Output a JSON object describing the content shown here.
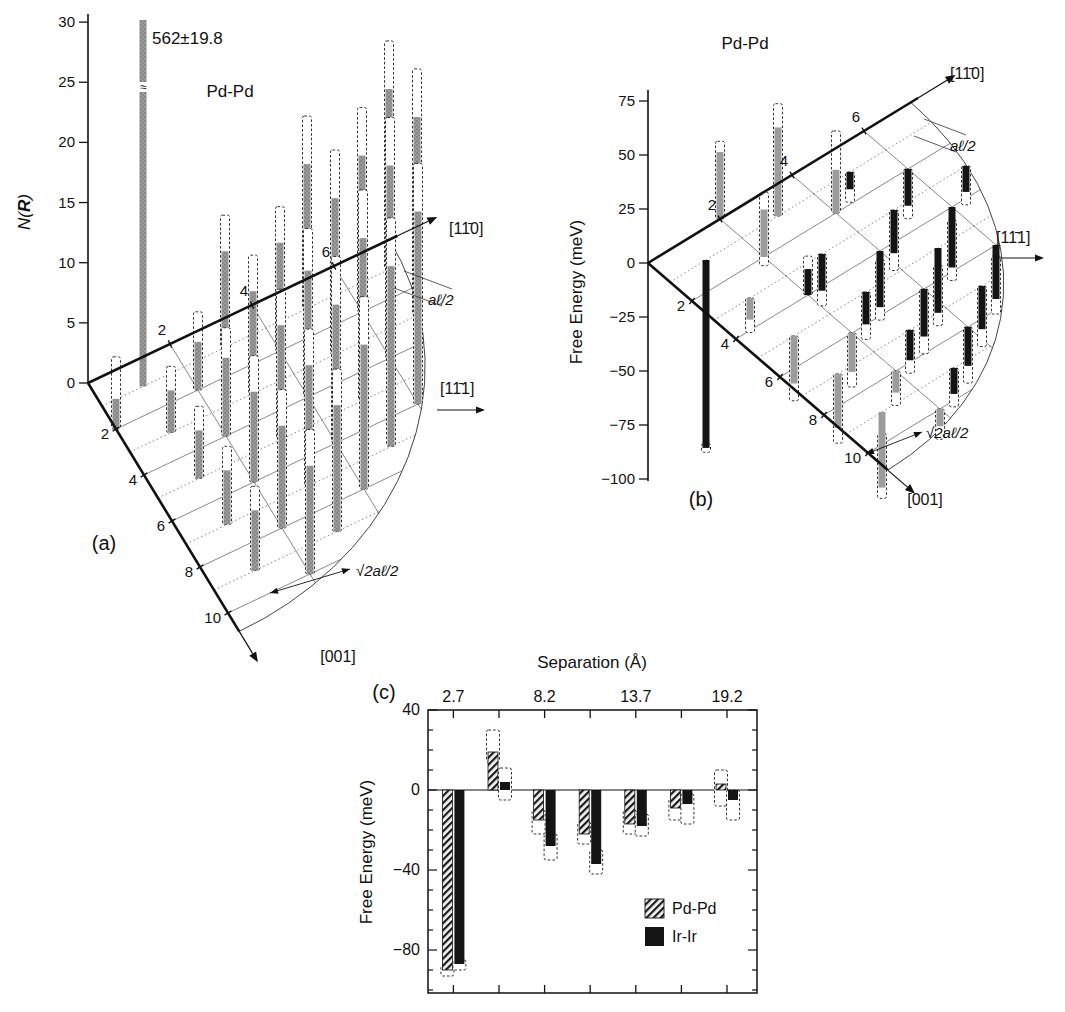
{
  "chart_data": [
    {
      "type": "3d-bar-lattice",
      "panel": "(a)",
      "title": "Pd-Pd",
      "ylabel": "N(R)",
      "ylabel_parts": {
        "pre": "N(",
        "arg": "R",
        "post": ")"
      },
      "yticks": [
        0,
        5,
        10,
        15,
        20,
        25,
        30
      ],
      "axes": {
        "up": "[11̄0]",
        "right": "[11̄1]",
        "down": "[001]"
      },
      "up_ticks": [
        2,
        4,
        6
      ],
      "down_ticks": [
        2,
        4,
        6,
        8,
        10
      ],
      "annotations": {
        "a_half": "aℓ/2",
        "sqrt2_a_half": "√2aℓ/2"
      },
      "peak": {
        "i": 1,
        "j": 1,
        "value": "562±19.8"
      },
      "bars": [
        {
          "i": 0,
          "j": 2,
          "v": 2.5,
          "e": 6
        },
        {
          "i": 2,
          "j": 2,
          "v": 4,
          "e": 6.5
        },
        {
          "i": 4,
          "j": 2,
          "v": 9,
          "e": 12
        },
        {
          "i": 6,
          "j": 2,
          "v": 13,
          "e": 17
        },
        {
          "i": 3,
          "j": 1,
          "v": 8,
          "e": 11
        },
        {
          "i": 5,
          "j": 1,
          "v": 12,
          "e": 16
        },
        {
          "i": 7,
          "j": 1,
          "v": 15,
          "e": 19
        },
        {
          "i": 1,
          "j": 3,
          "v": 3.5,
          "e": 5.5
        },
        {
          "i": 3,
          "j": 3,
          "v": 8.5,
          "e": 11.5
        },
        {
          "i": 5,
          "j": 3,
          "v": 13,
          "e": 17
        },
        {
          "i": 7,
          "j": 3,
          "v": 16.5,
          "e": 20.5
        },
        {
          "i": 2,
          "j": 4,
          "v": 6.5,
          "e": 9
        },
        {
          "i": 4,
          "j": 4,
          "v": 10.5,
          "e": 14
        },
        {
          "i": 6,
          "j": 4,
          "v": 16,
          "e": 20
        },
        {
          "i": 1,
          "j": 5,
          "v": 4,
          "e": 6
        },
        {
          "i": 3,
          "j": 5,
          "v": 9.5,
          "e": 12.5
        },
        {
          "i": 5,
          "j": 5,
          "v": 13.5,
          "e": 17.5
        },
        {
          "i": 2,
          "j": 6,
          "v": 7.5,
          "e": 10.5
        },
        {
          "i": 4,
          "j": 6,
          "v": 11.5,
          "e": 15.5
        },
        {
          "i": 6,
          "j": 6,
          "v": 16,
          "e": 20
        },
        {
          "i": 1,
          "j": 7,
          "v": 4.5,
          "e": 6.5
        },
        {
          "i": 3,
          "j": 7,
          "v": 10,
          "e": 13
        },
        {
          "i": 5,
          "j": 7,
          "v": 15,
          "e": 19
        },
        {
          "i": 2,
          "j": 8,
          "v": 8.5,
          "e": 11.5
        },
        {
          "i": 4,
          "j": 8,
          "v": 12,
          "e": 16
        },
        {
          "i": 1,
          "j": 9,
          "v": 5,
          "e": 7
        },
        {
          "i": 3,
          "j": 9,
          "v": 10.5,
          "e": 13.5
        },
        {
          "i": 2,
          "j": 10,
          "v": 9,
          "e": 12
        }
      ]
    },
    {
      "type": "3d-bar-lattice",
      "panel": "(b)",
      "title": "Pd-Pd",
      "ylabel": "Free Energy (meV)",
      "yticks": [
        75,
        50,
        25,
        0,
        -25,
        -50,
        -75,
        -100
      ],
      "axes": {
        "up": "[11̄0]",
        "right": "[11̄1]",
        "down": "[001]"
      },
      "up_ticks": [
        2,
        4,
        6
      ],
      "down_ticks": [
        2,
        4,
        6,
        8,
        10
      ],
      "annotations": {
        "a_half": "aℓ/2",
        "sqrt2_a_half": "√2aℓ/2"
      },
      "bars": [
        {
          "i": 1,
          "j": 1,
          "v": -87,
          "e": [
            -89,
            -85
          ],
          "c": "k"
        },
        {
          "i": 2,
          "j": 0,
          "v": 31,
          "e": [
            0,
            36
          ],
          "c": "g"
        },
        {
          "i": 3,
          "j": 1,
          "v": 41,
          "e": [
            0,
            52
          ],
          "c": "g"
        },
        {
          "i": 5,
          "j": 1,
          "v": -8,
          "e": [
            -14,
            0
          ],
          "c": "k"
        },
        {
          "i": 2,
          "j": 2,
          "v": 22,
          "e": [
            -4,
            30
          ],
          "c": "g"
        },
        {
          "i": 4,
          "j": 2,
          "v": 20,
          "e": [
            0,
            38
          ],
          "c": "g"
        },
        {
          "i": 6,
          "j": 2,
          "v": -17,
          "e": [
            -23,
            0
          ],
          "c": "k"
        },
        {
          "i": 1,
          "j": 3,
          "v": -10,
          "e": [
            -16,
            0
          ],
          "c": "g"
        },
        {
          "i": 3,
          "j": 3,
          "v": -17,
          "e": [
            -24,
            0
          ],
          "c": "k"
        },
        {
          "i": 5,
          "j": 3,
          "v": -20,
          "e": [
            -28,
            0
          ],
          "c": "k"
        },
        {
          "i": 7,
          "j": 3,
          "v": -12,
          "e": [
            -18,
            0
          ],
          "c": "k"
        },
        {
          "i": 2,
          "j": 4,
          "v": 12,
          "e": [
            0,
            18
          ],
          "c": "k"
        },
        {
          "i": 4,
          "j": 4,
          "v": -26,
          "e": [
            -32,
            -4
          ],
          "c": "k"
        },
        {
          "i": 6,
          "j": 4,
          "v": -28,
          "e": [
            -34,
            -6
          ],
          "c": "k"
        },
        {
          "i": 1,
          "j": 5,
          "v": -22,
          "e": [
            -30,
            0
          ],
          "c": "g"
        },
        {
          "i": 3,
          "j": 5,
          "v": -15,
          "e": [
            -22,
            0
          ],
          "c": "k"
        },
        {
          "i": 5,
          "j": 5,
          "v": -30,
          "e": [
            -36,
            -8
          ],
          "c": "k"
        },
        {
          "i": 2,
          "j": 6,
          "v": -18,
          "e": [
            -25,
            0
          ],
          "c": "g"
        },
        {
          "i": 4,
          "j": 6,
          "v": -22,
          "e": [
            -30,
            0
          ],
          "c": "k"
        },
        {
          "i": 6,
          "j": 6,
          "v": -25,
          "e": [
            -32,
            -5
          ],
          "c": "k"
        },
        {
          "i": 1,
          "j": 7,
          "v": -25,
          "e": [
            -32,
            0
          ],
          "c": "g"
        },
        {
          "i": 3,
          "j": 7,
          "v": -14,
          "e": [
            -20,
            0
          ],
          "c": "k"
        },
        {
          "i": 5,
          "j": 7,
          "v": -20,
          "e": [
            -28,
            0
          ],
          "c": "k"
        },
        {
          "i": 2,
          "j": 8,
          "v": -10,
          "e": [
            -16,
            0
          ],
          "c": "g"
        },
        {
          "i": 4,
          "j": 8,
          "v": -18,
          "e": [
            -26,
            0
          ],
          "c": "k"
        },
        {
          "i": 1,
          "j": 9,
          "v": -35,
          "e": [
            -40,
            -10
          ],
          "c": "g"
        },
        {
          "i": 3,
          "j": 9,
          "v": -12,
          "e": [
            -18,
            0
          ],
          "c": "k"
        },
        {
          "i": 2,
          "j": 10,
          "v": -8,
          "e": [
            -14,
            0
          ],
          "c": "g"
        }
      ]
    },
    {
      "type": "bar",
      "panel": "(c)",
      "xlabel": "Separation (Å)",
      "ylabel": "Free Energy (meV)",
      "x_tick_labels": [
        "2.7",
        "8.2",
        "13.7",
        "19.2"
      ],
      "yticks": [
        40,
        0,
        -40,
        -80
      ],
      "ylim": [
        -101,
        41
      ],
      "n_groups": 7,
      "series": [
        {
          "name": "Pd-Pd",
          "style": "hatched",
          "values": [
            -90,
            19,
            -15,
            -22,
            -17,
            -9,
            3
          ],
          "errors": [
            [
              -93,
              -88
            ],
            [
              14,
              30
            ],
            [
              -22,
              -10
            ],
            [
              -27,
              -16
            ],
            [
              -22,
              -10
            ],
            [
              -15,
              -4
            ],
            [
              -8,
              10
            ]
          ]
        },
        {
          "name": "Ir-Ir",
          "style": "solid-black",
          "values": [
            -87,
            4,
            -28,
            -37,
            -18,
            -7,
            -5
          ],
          "errors": [
            [
              -90,
              -85
            ],
            [
              -5,
              11
            ],
            [
              -35,
              -22
            ],
            [
              -42,
              -30
            ],
            [
              -23,
              -12
            ],
            [
              -17,
              -2
            ],
            [
              -15,
              0
            ]
          ]
        }
      ]
    }
  ]
}
